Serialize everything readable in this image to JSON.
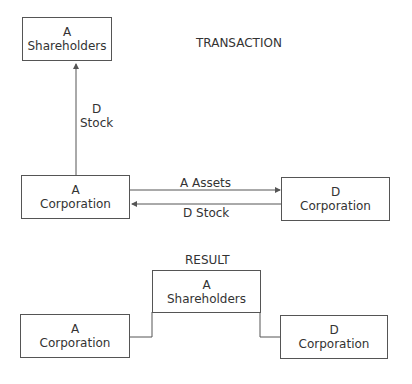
{
  "transaction": {
    "title": "TRANSACTION",
    "a_shareholders": {
      "line1": "A",
      "line2": "Shareholders"
    },
    "a_corporation": {
      "line1": "A",
      "line2": "Corporation"
    },
    "d_corporation": {
      "line1": "D",
      "line2": "Corporation"
    },
    "arrow_up_label": {
      "line1": "D",
      "line2": "Stock"
    },
    "arrow_right_label": "A  Assets",
    "arrow_left_label": "D  Stock"
  },
  "result": {
    "title": "RESULT",
    "a_shareholders": {
      "line1": "A",
      "line2": "Shareholders"
    },
    "a_corporation": {
      "line1": "A",
      "line2": "Corporation"
    },
    "d_corporation": {
      "line1": "D",
      "line2": "Corporation"
    }
  },
  "colors": {
    "line": "#555555",
    "text": "#333333",
    "background": "#ffffff"
  }
}
